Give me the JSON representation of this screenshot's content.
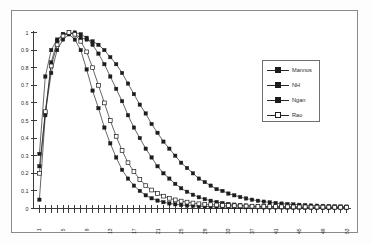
{
  "chart_data": {
    "type": "line",
    "title": "",
    "subtitle": "",
    "xlabel": "",
    "ylabel": "",
    "ylim": [
      0,
      1
    ],
    "xlim": [
      0,
      53
    ],
    "grid": false,
    "legend_position": "right",
    "y_ticks": [
      "0",
      "0.1",
      "0.2",
      "0.3",
      "0.4",
      "0.5",
      "0.6",
      "0.7",
      "0.8",
      "0.9",
      "1"
    ],
    "y_tick_values": [
      0,
      0.1,
      0.2,
      0.3,
      0.4,
      0.5,
      0.6,
      0.7,
      0.8,
      0.9,
      1
    ],
    "x_ticks": [
      "1",
      "5",
      "9",
      "13",
      "17",
      "21",
      "25",
      "29",
      "33",
      "37",
      "41",
      "45",
      "49",
      "53"
    ],
    "x_tick_values": [
      1,
      5,
      9,
      13,
      17,
      21,
      25,
      29,
      33,
      37,
      41,
      45,
      49,
      53
    ],
    "x_tick_rotation": -90,
    "marker": "square",
    "x": [
      1,
      2,
      3,
      4,
      5,
      6,
      7,
      8,
      9,
      10,
      11,
      12,
      13,
      14,
      15,
      16,
      17,
      18,
      19,
      20,
      21,
      22,
      23,
      24,
      25,
      26,
      27,
      28,
      29,
      30,
      31,
      32,
      33,
      34,
      35,
      36,
      37,
      38,
      39,
      40,
      41,
      42,
      43,
      44,
      45,
      46,
      47,
      48,
      49,
      50,
      51,
      52,
      53
    ],
    "series": [
      {
        "name": "Mannos",
        "marker": "filled-square",
        "color": "#1c1c1c",
        "values": [
          0.31,
          0.75,
          0.9,
          0.96,
          0.99,
          1.0,
          0.99,
          0.97,
          0.96,
          0.95,
          0.93,
          0.9,
          0.86,
          0.82,
          0.77,
          0.71,
          0.65,
          0.59,
          0.54,
          0.48,
          0.43,
          0.38,
          0.34,
          0.3,
          0.26,
          0.23,
          0.2,
          0.17,
          0.15,
          0.13,
          0.11,
          0.1,
          0.085,
          0.075,
          0.065,
          0.057,
          0.05,
          0.044,
          0.039,
          0.035,
          0.031,
          0.028,
          0.025,
          0.023,
          0.021,
          0.019,
          0.017,
          0.016,
          0.015,
          0.014,
          0.013,
          0.012,
          0.011
        ]
      },
      {
        "name": "NH",
        "marker": "filled-square",
        "color": "#1c1c1c",
        "values": [
          0.24,
          0.54,
          0.77,
          0.9,
          0.96,
          0.99,
          1.0,
          0.99,
          0.97,
          0.93,
          0.88,
          0.82,
          0.75,
          0.68,
          0.61,
          0.53,
          0.46,
          0.4,
          0.34,
          0.29,
          0.24,
          0.2,
          0.17,
          0.14,
          0.115,
          0.095,
          0.078,
          0.064,
          0.053,
          0.044,
          0.037,
          0.031,
          0.026,
          0.022,
          0.019,
          0.017,
          0.015,
          0.013,
          0.012,
          0.011,
          0.01,
          0.009,
          0.009,
          0.008,
          0.008,
          0.007,
          0.007,
          0.007,
          0.006,
          0.006,
          0.006,
          0.006,
          0.005
        ]
      },
      {
        "name": "Ngan",
        "marker": "filled-square",
        "color": "#1c1c1c",
        "values": [
          0.05,
          0.53,
          0.83,
          0.95,
          0.99,
          0.99,
          0.96,
          0.9,
          0.79,
          0.67,
          0.57,
          0.46,
          0.37,
          0.29,
          0.22,
          0.17,
          0.13,
          0.1,
          0.075,
          0.058,
          0.045,
          0.036,
          0.029,
          0.024,
          0.02,
          0.017,
          0.015,
          0.013,
          0.012,
          0.011,
          0.01,
          0.009,
          0.009,
          0.008,
          0.008,
          0.007,
          0.007,
          0.007,
          0.006,
          0.006,
          0.006,
          0.006,
          0.005,
          0.005,
          0.005,
          0.005,
          0.005,
          0.005,
          0.005,
          0.004,
          0.004,
          0.004,
          0.004
        ]
      },
      {
        "name": "Rao",
        "marker": "open-square",
        "color": "#1c1c1c",
        "values": [
          0.2,
          0.55,
          0.81,
          0.93,
          0.98,
          1.0,
          0.99,
          0.95,
          0.89,
          0.8,
          0.7,
          0.6,
          0.5,
          0.41,
          0.33,
          0.26,
          0.21,
          0.165,
          0.13,
          0.105,
          0.085,
          0.07,
          0.058,
          0.049,
          0.042,
          0.036,
          0.031,
          0.027,
          0.024,
          0.022,
          0.02,
          0.018,
          0.017,
          0.016,
          0.015,
          0.014,
          0.013,
          0.012,
          0.012,
          0.011,
          0.011,
          0.01,
          0.01,
          0.009,
          0.009,
          0.009,
          0.008,
          0.008,
          0.008,
          0.008,
          0.007,
          0.007,
          0.007
        ]
      }
    ]
  },
  "legend": {
    "items": [
      {
        "label": "Mannos"
      },
      {
        "label": "NH"
      },
      {
        "label": "Ngan"
      },
      {
        "label": "Rao"
      }
    ]
  }
}
